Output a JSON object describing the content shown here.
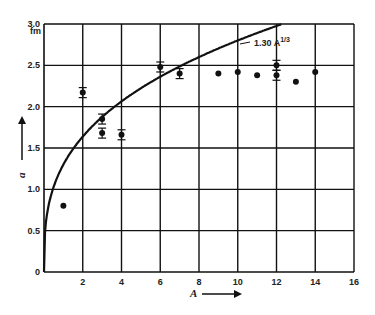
{
  "chart_data": {
    "type": "scatter",
    "title": "",
    "xlabel": "A",
    "ylabel": "a",
    "y_unit": "fm",
    "xlim": [
      0,
      16
    ],
    "ylim": [
      0,
      3.0
    ],
    "x_ticks": [
      "2",
      "4",
      "6",
      "8",
      "10",
      "12",
      "14",
      "16"
    ],
    "y_ticks": [
      "0",
      "0.5",
      "1.0",
      "1.5",
      "2.0",
      "2.5",
      "3.0"
    ],
    "grid": true,
    "series": [
      {
        "name": "measured",
        "x": [
          1,
          2,
          3,
          3,
          4,
          6,
          7,
          9,
          10,
          11,
          12,
          12,
          13,
          14
        ],
        "y": [
          0.8,
          2.17,
          1.85,
          1.68,
          1.66,
          2.48,
          2.4,
          2.4,
          2.42,
          2.38,
          2.5,
          2.38,
          2.3,
          2.42
        ]
      },
      {
        "name": "1.30 A^1/3",
        "type": "line",
        "formula": "1.30*A^(1/3)"
      }
    ],
    "annotations": [
      "1.30 A^1/3"
    ]
  },
  "labels": {
    "curve": "1.30 A",
    "curve_exp": "1/3",
    "unit": "fm",
    "xlabel": "A",
    "ylabel": "a"
  }
}
